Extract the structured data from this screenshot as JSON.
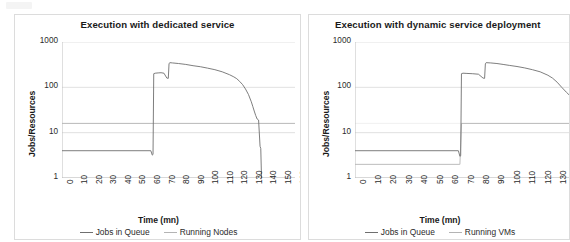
{
  "figure": {
    "background": "#ffffff",
    "panel_border": "#dcdcdc",
    "series_colors": {
      "jobs_in_queue": "#6f6f6f",
      "resources": "#b4b4b4"
    }
  },
  "charts": [
    {
      "id": "dedicated",
      "title": "Execution with dedicated service",
      "ylabel": "Jobs/Resources",
      "xlabel": "Time (mn)",
      "legend": [
        {
          "label": "Jobs in Queue",
          "color": "#6f6f6f"
        },
        {
          "label": "Running Nodes",
          "color": "#b4b4b4"
        }
      ],
      "yticks": [
        "1",
        "10",
        "100",
        "1000"
      ],
      "xticks": [
        "0",
        "10",
        "20",
        "30",
        "40",
        "50",
        "60",
        "70",
        "80",
        "90",
        "100",
        "110",
        "120",
        "130",
        "140",
        "150",
        "160"
      ]
    },
    {
      "id": "dynamic",
      "title": "Execution with dynamic service deployment",
      "ylabel": "Jobs/Resources",
      "xlabel": "Time (mn)",
      "legend": [
        {
          "label": "Jobs in Queue",
          "color": "#6f6f6f"
        },
        {
          "label": "Running VMs",
          "color": "#b4b4b4"
        }
      ],
      "yticks": [
        "1",
        "10",
        "100",
        "1000"
      ],
      "xticks": [
        "0",
        "10",
        "20",
        "30",
        "40",
        "50",
        "60",
        "70",
        "80",
        "90",
        "100",
        "110",
        "120",
        "130"
      ]
    }
  ],
  "chart_data": [
    {
      "type": "line",
      "title": "Execution with dedicated service",
      "xlabel": "Time (mn)",
      "ylabel": "Jobs/Resources",
      "xlim": [
        0,
        160
      ],
      "ylim": [
        1,
        1000
      ],
      "yscale": "log",
      "grid": true,
      "legend_position": "bottom",
      "series": [
        {
          "name": "Jobs in Queue",
          "color": "#6f6f6f",
          "x": [
            0,
            61,
            62,
            62.5,
            63,
            64,
            66,
            68,
            70,
            72,
            73,
            73.5,
            74,
            76,
            80,
            85,
            90,
            95,
            100,
            105,
            110,
            115,
            118,
            120,
            122,
            124,
            126,
            128,
            130,
            131,
            132,
            133,
            134,
            135,
            136,
            136.5,
            137
          ],
          "y": [
            4,
            4,
            3.2,
            3.3,
            200,
            205,
            208,
            210,
            205,
            160,
            158,
            330,
            350,
            345,
            335,
            320,
            300,
            285,
            265,
            245,
            220,
            190,
            170,
            155,
            135,
            115,
            92,
            70,
            48,
            38,
            30,
            24,
            20,
            19,
            5,
            4.5,
            1
          ]
        },
        {
          "name": "Running Nodes",
          "color": "#b4b4b4",
          "x": [
            0,
            160
          ],
          "y": [
            16,
            16
          ]
        }
      ]
    },
    {
      "type": "line",
      "title": "Execution with dynamic service deployment",
      "xlabel": "Time (mn)",
      "ylabel": "Jobs/Resources",
      "xlim": [
        0,
        140
      ],
      "ylim": [
        1,
        1000
      ],
      "yscale": "log",
      "grid": true,
      "legend_position": "bottom",
      "series": [
        {
          "name": "Jobs in Queue",
          "color": "#6f6f6f",
          "x": [
            0,
            67,
            68,
            68.5,
            69,
            70,
            72,
            76,
            80,
            83,
            84,
            84.5,
            85,
            88,
            92,
            96,
            100,
            105,
            110,
            115,
            120,
            125,
            128,
            131,
            134,
            137,
            140
          ],
          "y": [
            4,
            4,
            3.0,
            3.1,
            200,
            205,
            203,
            200,
            195,
            160,
            158,
            330,
            350,
            345,
            335,
            320,
            305,
            288,
            268,
            245,
            220,
            185,
            160,
            130,
            100,
            78,
            62
          ]
        },
        {
          "name": "Running VMs",
          "color": "#b4b4b4",
          "x": [
            0,
            67.5,
            68,
            69,
            140
          ],
          "y": [
            2,
            2,
            2,
            16,
            16
          ]
        }
      ]
    }
  ]
}
